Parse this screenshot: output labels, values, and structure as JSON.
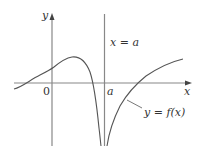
{
  "diagram": {
    "type": "function-graph",
    "labels": {
      "y_axis": "y",
      "x_axis": "x",
      "origin": "0",
      "a_tick": "a",
      "asymptote": "x = a",
      "curve": "y = f(x)"
    },
    "colors": {
      "axis": "#888888",
      "curve": "#555555",
      "text": "#333333"
    }
  }
}
